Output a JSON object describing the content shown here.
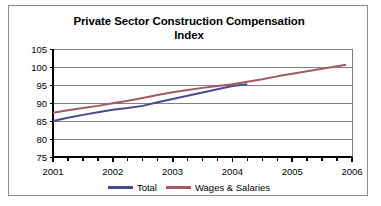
{
  "chart_data": {
    "type": "line",
    "title": "Private Sector Construction Compensation Index",
    "title_line1": "Private Sector Construction Compensation",
    "title_line2": "Index",
    "xlabel": "",
    "ylabel": "",
    "xlim": [
      2001,
      2006
    ],
    "ylim": [
      75,
      105
    ],
    "yticks": [
      75,
      80,
      85,
      90,
      95,
      100,
      105
    ],
    "xticks": [
      2001,
      2002,
      2003,
      2004,
      2005,
      2006
    ],
    "xtick_labels": [
      "2001",
      "2002",
      "2003",
      "2004",
      "2005",
      "2006"
    ],
    "ytick_labels": [
      "75",
      "80",
      "85",
      "90",
      "95",
      "100",
      "105"
    ],
    "minor_xticks_per_year": 4,
    "grid": "horizontal",
    "legend_position": "bottom",
    "series": [
      {
        "name": "Total",
        "color": "#4a4a8c",
        "x": [
          2001.0,
          2001.25,
          2001.5,
          2001.75,
          2002.0,
          2002.25,
          2002.5,
          2002.75,
          2003.0,
          2003.25,
          2003.5,
          2003.75,
          2004.0,
          2004.25
        ],
        "values": [
          85.0,
          85.9,
          86.7,
          87.4,
          88.1,
          88.6,
          89.2,
          90.2,
          91.1,
          92.0,
          92.9,
          93.8,
          94.7,
          95.2
        ]
      },
      {
        "name": "Wages & Salaries",
        "color": "#a05a63",
        "x": [
          2001.0,
          2001.25,
          2001.5,
          2001.75,
          2002.0,
          2002.25,
          2002.5,
          2002.75,
          2003.0,
          2003.25,
          2003.5,
          2003.75,
          2004.0,
          2004.25,
          2004.5,
          2004.75,
          2005.0,
          2005.25,
          2005.5,
          2005.75,
          2005.9
        ],
        "values": [
          87.3,
          88.0,
          88.6,
          89.2,
          89.9,
          90.6,
          91.4,
          92.2,
          93.0,
          93.6,
          94.2,
          94.7,
          95.2,
          95.9,
          96.6,
          97.4,
          98.1,
          98.8,
          99.5,
          100.2,
          100.6
        ]
      }
    ]
  },
  "legend": {
    "entries": [
      {
        "label": "Total",
        "color": "#4a4a8c"
      },
      {
        "label": "Wages & Salaries",
        "color": "#a05a63"
      }
    ]
  },
  "colors": {
    "total_line": "#4a4a8c",
    "wages_line": "#a05a63",
    "axis": "#000000",
    "grid": "#808080",
    "frame_border": "#8a8a8a"
  }
}
